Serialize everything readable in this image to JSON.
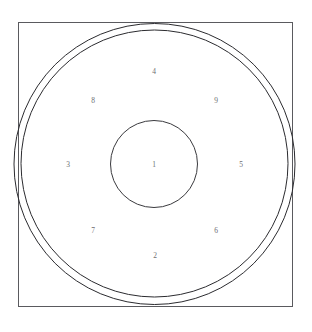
{
  "figure": {
    "title": "",
    "background_color": "#ffffff",
    "canvas": {
      "width": 312,
      "height": 332
    },
    "frame": {
      "name": "square-frame",
      "stroke_color": "#5a5a5e",
      "stroke_width": 1,
      "x": 18,
      "y": 22,
      "width": 274,
      "height": 284
    },
    "circles": [
      {
        "name": "outer-circle",
        "cx": 154.5,
        "cy": 164,
        "r": 140.5,
        "stroke_color": "#2b2b2f",
        "stroke_width": 1,
        "fill": "none"
      },
      {
        "name": "ring-inner-circle",
        "cx": 154.5,
        "cy": 163.5,
        "r": 133.5,
        "stroke_color": "#2b2b2f",
        "stroke_width": 1,
        "fill": "none"
      },
      {
        "name": "center-circle",
        "cx": 154,
        "cy": 164,
        "r": 43.5,
        "stroke_color": "#3a3a3e",
        "stroke_width": 1,
        "fill": "none"
      }
    ],
    "label_color": "#6e6e72",
    "labels": [
      {
        "name": "zone-label-1",
        "text": "1",
        "x": 154,
        "y": 165
      },
      {
        "name": "zone-label-2",
        "text": "2",
        "x": 155,
        "y": 256
      },
      {
        "name": "zone-label-3",
        "text": "3",
        "x": 68,
        "y": 165
      },
      {
        "name": "zone-label-4",
        "text": "4",
        "x": 154,
        "y": 72
      },
      {
        "name": "zone-label-5",
        "text": "5",
        "x": 241,
        "y": 165
      },
      {
        "name": "zone-label-6",
        "text": "6",
        "x": 216,
        "y": 231
      },
      {
        "name": "zone-label-7",
        "text": "7",
        "x": 93,
        "y": 231
      },
      {
        "name": "zone-label-8",
        "text": "8",
        "x": 93,
        "y": 101
      },
      {
        "name": "zone-label-9",
        "text": "9",
        "x": 216,
        "y": 101
      }
    ]
  }
}
